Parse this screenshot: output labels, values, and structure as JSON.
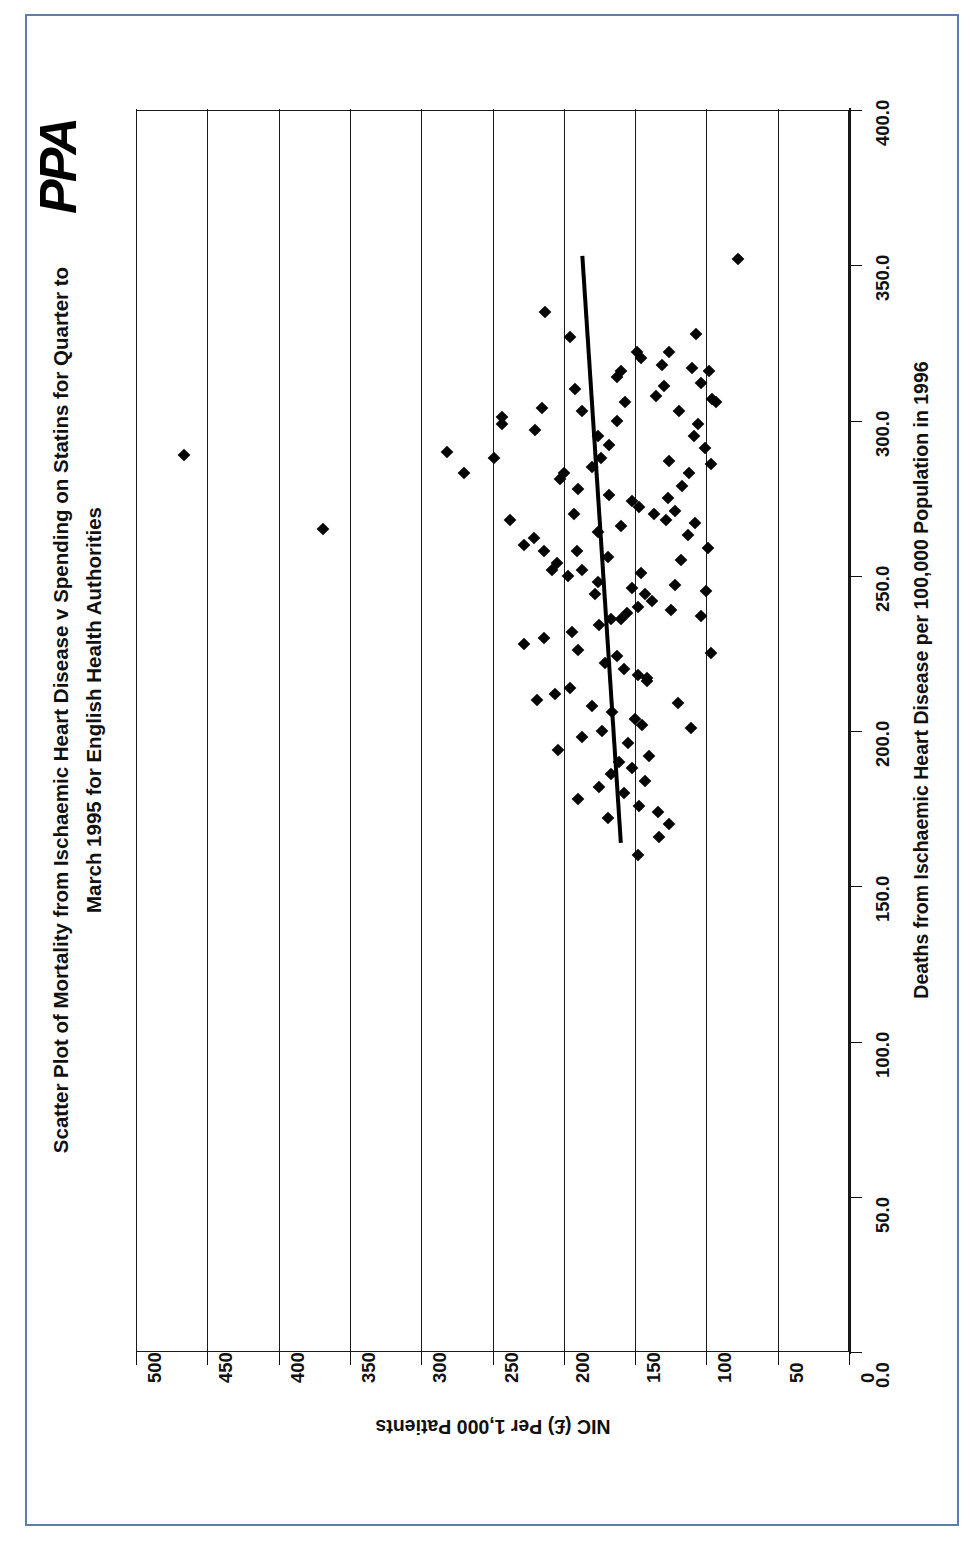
{
  "page": {
    "border_color": "#5b7fad",
    "background": "#ffffff",
    "logo_text": "PPA"
  },
  "chart_data": {
    "type": "scatter",
    "title": "Scatter Plot of Mortality from Ischaemic Heart Disease v Spending on Statins for Quarter to March 1995 for English Health Authorities",
    "title_line1": "Scatter Plot of Mortality from Ischaemic Heart Disease v Spending on Statins for Quarter to",
    "title_line2": "March 1995 for English Health Authorities",
    "xlabel": "Deaths from Ischaemic Heart Disease per 100,000 Population in 1996",
    "ylabel": "NIC (£) Per 1,000 Patients",
    "annotation": "R² = 0.0052",
    "r_squared": 0.0052,
    "grid": true,
    "legend": "none",
    "orientation": "rotated-90-ccw",
    "xlim": [
      0,
      400
    ],
    "ylim": [
      0,
      500
    ],
    "xticks": [
      "0.0",
      "50.0",
      "100.0",
      "150.0",
      "200.0",
      "250.0",
      "300.0",
      "350.0",
      "400.0"
    ],
    "xtick_values": [
      0,
      50,
      100,
      150,
      200,
      250,
      300,
      350,
      400
    ],
    "yticks": [
      "0",
      "50",
      "100",
      "150",
      "200",
      "250",
      "300",
      "350",
      "400",
      "450",
      "500"
    ],
    "ytick_values": [
      0,
      50,
      100,
      150,
      200,
      250,
      300,
      350,
      400,
      450,
      500
    ],
    "trendline": {
      "x1": 164,
      "y1": 160,
      "x2": 353,
      "y2": 187
    },
    "points": [
      [
        289,
        466
      ],
      [
        265,
        369
      ],
      [
        352,
        78
      ],
      [
        290,
        282
      ],
      [
        283,
        270
      ],
      [
        270,
        193
      ],
      [
        268,
        238
      ],
      [
        288,
        249
      ],
      [
        299,
        243
      ],
      [
        301,
        243
      ],
      [
        297,
        220
      ],
      [
        304,
        215
      ],
      [
        303,
        187
      ],
      [
        310,
        192
      ],
      [
        314,
        163
      ],
      [
        316,
        160
      ],
      [
        317,
        110
      ],
      [
        312,
        104
      ],
      [
        335,
        213
      ],
      [
        327,
        196
      ],
      [
        322,
        149
      ],
      [
        320,
        146
      ],
      [
        318,
        131
      ],
      [
        308,
        135
      ],
      [
        306,
        157
      ],
      [
        300,
        163
      ],
      [
        295,
        176
      ],
      [
        292,
        168
      ],
      [
        288,
        174
      ],
      [
        285,
        180
      ],
      [
        283,
        200
      ],
      [
        281,
        203
      ],
      [
        278,
        190
      ],
      [
        276,
        168
      ],
      [
        274,
        152
      ],
      [
        272,
        147
      ],
      [
        270,
        137
      ],
      [
        268,
        128
      ],
      [
        266,
        160
      ],
      [
        264,
        176
      ],
      [
        262,
        221
      ],
      [
        260,
        228
      ],
      [
        258,
        214
      ],
      [
        256,
        169
      ],
      [
        254,
        205
      ],
      [
        252,
        208
      ],
      [
        250,
        197
      ],
      [
        248,
        176
      ],
      [
        246,
        152
      ],
      [
        244,
        143
      ],
      [
        242,
        138
      ],
      [
        240,
        148
      ],
      [
        238,
        156
      ],
      [
        236,
        167
      ],
      [
        234,
        175
      ],
      [
        232,
        194
      ],
      [
        230,
        214
      ],
      [
        228,
        228
      ],
      [
        226,
        190
      ],
      [
        224,
        163
      ],
      [
        222,
        171
      ],
      [
        220,
        158
      ],
      [
        218,
        148
      ],
      [
        216,
        142
      ],
      [
        214,
        196
      ],
      [
        212,
        206
      ],
      [
        210,
        219
      ],
      [
        208,
        180
      ],
      [
        206,
        166
      ],
      [
        204,
        150
      ],
      [
        202,
        145
      ],
      [
        200,
        173
      ],
      [
        198,
        187
      ],
      [
        196,
        155
      ],
      [
        194,
        204
      ],
      [
        192,
        140
      ],
      [
        190,
        161
      ],
      [
        188,
        152
      ],
      [
        186,
        167
      ],
      [
        184,
        143
      ],
      [
        182,
        175
      ],
      [
        180,
        158
      ],
      [
        178,
        190
      ],
      [
        176,
        147
      ],
      [
        174,
        134
      ],
      [
        172,
        169
      ],
      [
        245,
        100
      ],
      [
        237,
        104
      ],
      [
        239,
        125
      ],
      [
        247,
        122
      ],
      [
        255,
        118
      ],
      [
        263,
        113
      ],
      [
        259,
        99
      ],
      [
        251,
        146
      ],
      [
        267,
        108
      ],
      [
        271,
        122
      ],
      [
        275,
        127
      ],
      [
        279,
        117
      ],
      [
        283,
        112
      ],
      [
        287,
        126
      ],
      [
        291,
        101
      ],
      [
        295,
        109
      ],
      [
        299,
        106
      ],
      [
        303,
        119
      ],
      [
        307,
        96
      ],
      [
        311,
        130
      ],
      [
        225,
        97
      ],
      [
        217,
        142
      ],
      [
        209,
        120
      ],
      [
        201,
        111
      ],
      [
        236,
        160
      ],
      [
        244,
        178
      ],
      [
        252,
        187
      ],
      [
        258,
        191
      ],
      [
        160,
        148
      ],
      [
        166,
        133
      ],
      [
        170,
        126
      ],
      [
        286,
        97
      ],
      [
        306,
        93
      ],
      [
        316,
        98
      ],
      [
        322,
        126
      ],
      [
        328,
        107
      ]
    ]
  }
}
